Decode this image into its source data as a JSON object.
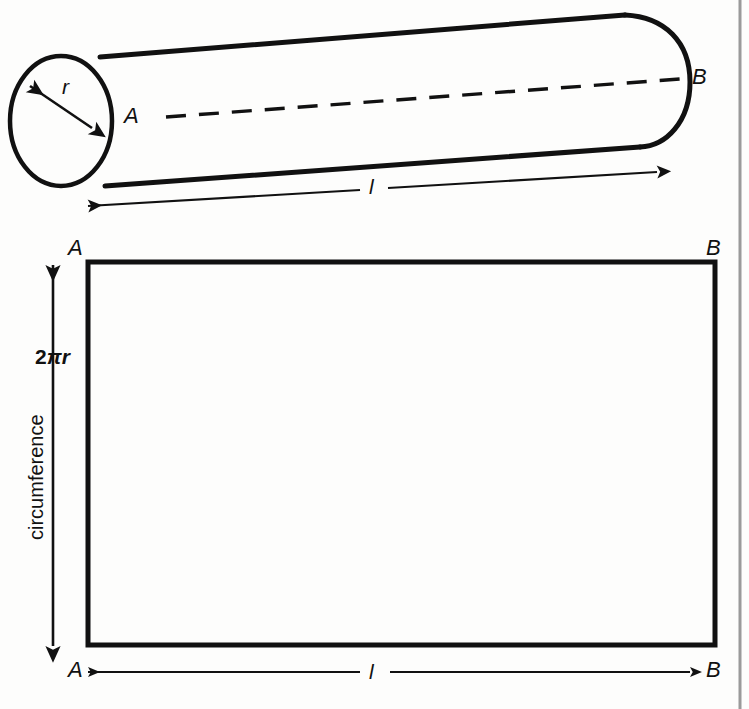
{
  "figure": {
    "ink_color": "#111111",
    "border_color": "#9a9a9a",
    "background": "#fdfdfc"
  },
  "cylinder": {
    "label_radius": "r",
    "label_end_near": "A",
    "label_end_far": "B",
    "label_length": "l"
  },
  "net": {
    "corner_top_left": "A",
    "corner_top_right": "B",
    "corner_bottom_left": "A",
    "corner_bottom_right": "B",
    "height_formula_prefix": "2",
    "height_formula_pi": "π",
    "height_formula_radius": "r",
    "height_caption": "circumference",
    "width_label": "l"
  }
}
